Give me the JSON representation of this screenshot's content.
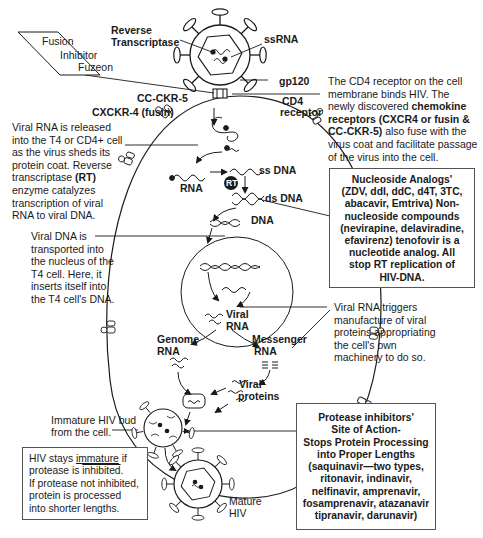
{
  "diagram": {
    "topic": "HIV life cycle and antiretroviral drug sites of action",
    "virus_labels": {
      "reverse_transcriptase_1": "Reverse",
      "reverse_transcriptase_2": "Transcriptase",
      "ssrna": "ssRNA",
      "gp120": "gp120",
      "cd4_1": "CD4",
      "cd4_2": "receptor",
      "cc_ckr5": "CC-CKR-5",
      "cxckr4": "CXCKR-4 (fusin)"
    },
    "fusion_box": {
      "line1": "Fusion",
      "line2": "Inhibitor",
      "line3": "Fuzeon"
    },
    "cd4_note": {
      "line1": "The CD4 receptor on the cell",
      "line2": "membrane binds HIV. The",
      "line3_plain": "newly discovered ",
      "line3_bold": "chemokine",
      "line4_bold": "receptors (CXCR4 or fusin &",
      "line5_bold": "CC-CKR-5)",
      "line5_plain": " also fuse with the",
      "line6": "virus coat and facilitate passage",
      "line7": "of the virus into the cell."
    },
    "viral_rna_note": {
      "lines": [
        "Viral RNA is released",
        "into the T4 or CD4+ cell",
        "as the virus sheds its",
        "protein coat. Reverse"
      ],
      "line5_plain": "transcriptase ",
      "line5_bold": "(RT)",
      "lines_after": [
        "enzyme catalyzes",
        "transcription of viral",
        "RNA to viral DNA."
      ]
    },
    "cell_labels": {
      "rna": "RNA",
      "rt": "RT",
      "ss_dna": "ss DNA",
      "ds_dna": "ds DNA",
      "dna": "DNA",
      "viral_rna_1": "Viral",
      "viral_rna_2": "RNA",
      "genome_rna_1": "Genome",
      "genome_rna_2": "RNA",
      "messenger_rna_1": "Messenger",
      "messenger_rna_2": "RNA",
      "viral_proteins_1": "Viral",
      "viral_proteins_2": "proteins"
    },
    "nucleoside_box": {
      "lines": [
        "Nucleoside Analogs'",
        "(ZDV, ddI, ddC, d4T, 3TC,",
        "abacavir, Emtriva) Non-",
        "nucleoside compounds",
        "(nevirapine, delaviradine,",
        "efavirenz) tenofovir is a",
        "nucleotide analog. All",
        "stop RT replication of",
        "HIV-DNA."
      ]
    },
    "viral_dna_note": {
      "lines": [
        "Viral DNA is",
        "transported into",
        "the nucleus of the",
        "T4 cell. Here, it",
        "inserts itself into",
        "the T4 cell's DNA."
      ]
    },
    "viral_rna_triggers_note": {
      "lines": [
        "Viral RNA triggers",
        "manufacture of viral",
        "proteins appropriating",
        "the cell's own",
        "machinery to do so."
      ]
    },
    "bud_note": {
      "line1": "Immature HIV bud",
      "line2": "from the cell."
    },
    "immature_box": {
      "line1_a": "HIV stays ",
      "line1_b": "immature",
      "line1_c": " if",
      "line2_a": "protease is ",
      "line2_b": "inhibited",
      "line2_c": ".",
      "line3": "If protease not inhibited,",
      "line4": "protein is processed",
      "line5": "into shorter lengths."
    },
    "protease_box": {
      "lines": [
        "Protease inhibitors'",
        "Site of Action-",
        "Stops Protein Processing",
        "into Proper Lengths",
        "(saquinavir—two types,",
        "ritonavir, indinavir,",
        "nelfinavir, amprenavir,",
        "fosamprenavir, atazanavir",
        "tipranavir, darunavir)"
      ]
    },
    "mature_label": {
      "line1": "Mature",
      "line2": "HIV"
    },
    "colors": {
      "ink": "#1a1a1a",
      "box_border": "#555555",
      "background": "#ffffff"
    }
  }
}
